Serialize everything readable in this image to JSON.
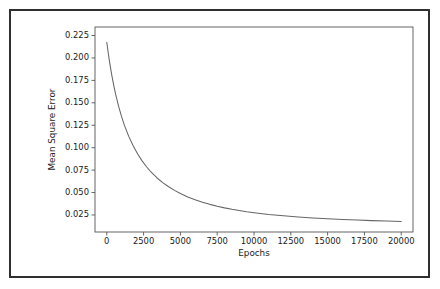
{
  "chart_data": {
    "type": "line",
    "title": "",
    "xlabel": "Epochs",
    "ylabel": "Mean Square Error",
    "xlim": [
      -800,
      20800
    ],
    "ylim": [
      0.006,
      0.2345
    ],
    "grid": false,
    "legend": null,
    "xticks": [
      0,
      2500,
      5000,
      7500,
      10000,
      12500,
      15000,
      17500,
      20000
    ],
    "xtick_labels": [
      "0",
      "2500",
      "5000",
      "7500",
      "10000",
      "12500",
      "15000",
      "17500",
      "20000"
    ],
    "yticks": [
      0.025,
      0.05,
      0.075,
      0.1,
      0.125,
      0.15,
      0.175,
      0.2,
      0.225
    ],
    "ytick_labels": [
      "0.025",
      "0.050",
      "0.075",
      "0.100",
      "0.125",
      "0.150",
      "0.175",
      "0.200",
      "0.225"
    ],
    "series": [
      {
        "name": "Mean Square Error",
        "color": "#666666",
        "x": [
          0,
          100,
          200,
          300,
          400,
          500,
          600,
          800,
          1000,
          1200,
          1500,
          1800,
          2100,
          2400,
          2700,
          3000,
          3400,
          3800,
          4200,
          4600,
          5000,
          5500,
          6000,
          6500,
          7000,
          7500,
          8000,
          8500,
          9000,
          9500,
          10000,
          11000,
          12000,
          13000,
          14000,
          15000,
          16000,
          17000,
          18000,
          19000,
          20000
        ],
        "y": [
          0.2175,
          0.2055,
          0.1945,
          0.1845,
          0.1755,
          0.1672,
          0.1596,
          0.1462,
          0.1348,
          0.1249,
          0.1123,
          0.1018,
          0.0929,
          0.0853,
          0.0787,
          0.0729,
          0.0665,
          0.0611,
          0.0564,
          0.0524,
          0.0489,
          0.0451,
          0.0419,
          0.0392,
          0.0368,
          0.0347,
          0.0329,
          0.0313,
          0.0299,
          0.0286,
          0.0275,
          0.0256,
          0.0241,
          0.0228,
          0.0217,
          0.0208,
          0.02,
          0.0193,
          0.0187,
          0.0182,
          0.0177
        ]
      }
    ]
  },
  "figure": {
    "axis_color": "#555555",
    "text_color": "#1a1a1a",
    "frame_color": "#2f2f2f",
    "background": "#ffffff"
  }
}
